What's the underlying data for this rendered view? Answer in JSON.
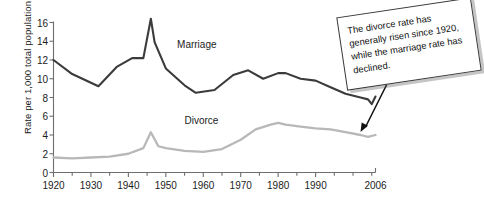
{
  "chart_data": {
    "type": "line",
    "title": "",
    "xlabel": "",
    "ylabel": "Rate per 1,000 total population",
    "xlim": [
      1920,
      2006
    ],
    "ylim": [
      0,
      16
    ],
    "grid": false,
    "legend_position": "inline-labels",
    "y_ticks": [
      0,
      2,
      4,
      6,
      8,
      10,
      12,
      14,
      16
    ],
    "y_tick_labels": [
      "0",
      "2",
      "4",
      "6",
      "8",
      "10",
      "12",
      "14",
      "16"
    ],
    "x_ticks": [
      1920,
      1930,
      1940,
      1950,
      1960,
      1970,
      1980,
      1990,
      2006
    ],
    "x_tick_labels": [
      "1920",
      "1930",
      "1940",
      "1950",
      "1960",
      "1970",
      "1980",
      "1990",
      "2006"
    ],
    "x_minor_tick_interval": 5,
    "series": [
      {
        "name": "Marriage",
        "color": "#3b3b3b",
        "label_x": 1953,
        "label_y": 13.6,
        "x": [
          1920,
          1925,
          1932,
          1937,
          1941,
          1944,
          1946,
          1947,
          1950,
          1955,
          1958,
          1963,
          1968,
          1972,
          1976,
          1980,
          1982,
          1986,
          1990,
          1994,
          1998,
          2002,
          2004,
          2005,
          2006
        ],
        "values": [
          12.0,
          10.5,
          9.2,
          11.3,
          12.2,
          12.2,
          16.4,
          13.9,
          11.1,
          9.3,
          8.5,
          8.8,
          10.4,
          10.9,
          10.0,
          10.6,
          10.6,
          10.0,
          9.8,
          9.1,
          8.4,
          8.0,
          7.8,
          7.3,
          8.1
        ]
      },
      {
        "name": "Divorce",
        "color": "#b8b8b8",
        "label_x": 1955,
        "label_y": 5.5,
        "x": [
          1920,
          1925,
          1930,
          1935,
          1940,
          1944,
          1946,
          1948,
          1950,
          1955,
          1960,
          1965,
          1970,
          1974,
          1978,
          1980,
          1982,
          1986,
          1990,
          1994,
          1998,
          2002,
          2004,
          2006
        ],
        "values": [
          1.6,
          1.5,
          1.6,
          1.7,
          2.0,
          2.6,
          4.3,
          2.8,
          2.6,
          2.3,
          2.2,
          2.5,
          3.5,
          4.6,
          5.1,
          5.3,
          5.1,
          4.9,
          4.7,
          4.6,
          4.3,
          4.0,
          3.8,
          4.0
        ]
      }
    ],
    "annotation": {
      "text": "The divorce rate has generally risen since 1920, while the marriage rate has declined.",
      "points_to_series": "Divorce",
      "points_to_x": 2002,
      "points_to_y": 4.0,
      "box_rotation_deg": -8.5
    },
    "axis_color": "#6e6e6e",
    "text_color": "#1c1c1c",
    "background": "#ffffff"
  }
}
